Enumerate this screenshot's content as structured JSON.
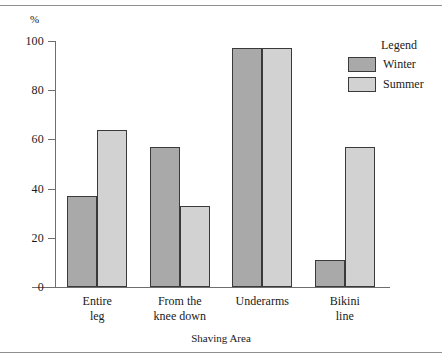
{
  "chart_data": {
    "type": "bar",
    "title": "",
    "subtitle": "",
    "xlabel": "Shaving Area",
    "ylabel": "%",
    "ylim": [
      0,
      100
    ],
    "grid": false,
    "legend_position": "right",
    "legend_title": "Legend",
    "categories": [
      "Entire leg",
      "From the knee down",
      "Underarms",
      "Bikini line"
    ],
    "category_lines": [
      [
        "Entire",
        "leg"
      ],
      [
        "From the",
        "knee down"
      ],
      [
        "Underarms",
        ""
      ],
      [
        "Bikini",
        "line"
      ]
    ],
    "y_ticks": [
      0,
      20,
      40,
      60,
      80,
      100
    ],
    "y_tick_labels": [
      "0",
      "20",
      "40",
      "60",
      "80",
      "100"
    ],
    "series": [
      {
        "name": "Winter",
        "color": "#a9a9a9",
        "values": [
          37,
          57,
          97,
          11
        ]
      },
      {
        "name": "Summer",
        "color": "#d2d2d2",
        "values": [
          64,
          33,
          97,
          57
        ]
      }
    ]
  },
  "axes": {
    "y_unit": "%",
    "x_title": "Shaving Area"
  },
  "legend": {
    "title": "Legend",
    "items": [
      {
        "label": "Winter",
        "color": "#a9a9a9"
      },
      {
        "label": "Summer",
        "color": "#d2d2d2"
      }
    ]
  },
  "style": {
    "bar_border": "#3a3a3a",
    "axis_color": "#6e6e6e",
    "rule_color": "#8f8f8f",
    "text_color": "#1a1a1a",
    "background": "#ffffff"
  }
}
